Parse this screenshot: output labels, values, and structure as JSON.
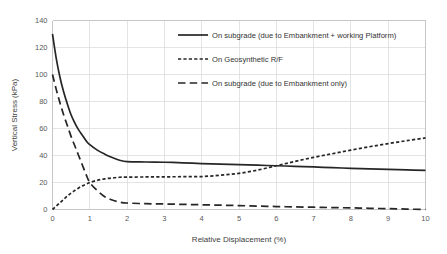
{
  "chart_data": {
    "type": "line",
    "title": "",
    "xlabel": "Relative Displacement (%)",
    "ylabel": "Vertical Stress (kPa)",
    "xlim": [
      0,
      10
    ],
    "ylim": [
      0,
      140
    ],
    "xticks": [
      "0",
      "1",
      "2",
      "3",
      "4",
      "5",
      "6",
      "7",
      "8",
      "9",
      "10"
    ],
    "yticks": [
      "0",
      "20",
      "40",
      "60",
      "80",
      "100",
      "120",
      "140"
    ],
    "grid": true,
    "legend_position": "upper-right-inside",
    "line_color": "#262626",
    "grid_color": "#d9d9d9",
    "x": [
      0,
      0.1,
      0.2,
      0.3,
      0.4,
      0.5,
      0.6,
      0.7,
      0.8,
      0.9,
      1.0,
      1.2,
      1.4,
      1.6,
      1.8,
      2.0,
      2.5,
      3.0,
      3.5,
      4.0,
      4.5,
      5.0,
      5.5,
      6.0,
      6.5,
      7.0,
      7.5,
      8.0,
      8.5,
      9.0,
      9.5,
      10.0
    ],
    "series": [
      {
        "name": "On subgrade (due to Embankment + working Platform)",
        "style": "solid",
        "values": [
          130,
          112,
          98,
          87,
          78,
          70,
          64,
          59,
          55,
          51,
          48,
          44,
          41,
          38.5,
          36.5,
          35.5,
          35.2,
          35,
          34.6,
          34,
          33.6,
          33.2,
          32.8,
          32.4,
          32,
          31.5,
          31,
          30.5,
          30.1,
          29.7,
          29.3,
          29
        ]
      },
      {
        "name": "On Geosynthetic R/F",
        "style": "dotted",
        "values": [
          0,
          2.5,
          5,
          7.5,
          10,
          12.2,
          14.2,
          16,
          17.5,
          18.8,
          20,
          21.6,
          22.7,
          23.4,
          23.9,
          24,
          24.1,
          24.2,
          24.3,
          24.4,
          25.4,
          26.8,
          29.2,
          32.4,
          35.6,
          38.6,
          41.3,
          44,
          46.5,
          48.8,
          51,
          53
        ]
      },
      {
        "name": "On subgrade (due to Embankment only)",
        "style": "dashed",
        "values": [
          100,
          89,
          79,
          70,
          62,
          54,
          47,
          40,
          33,
          26,
          20,
          14,
          9.5,
          7,
          5.5,
          4.8,
          4.3,
          4.1,
          3.8,
          3.5,
          3.2,
          2.9,
          2.5,
          2.2,
          1.9,
          1.7,
          1.4,
          1.2,
          0.9,
          0.6,
          0.3,
          0
        ]
      }
    ]
  },
  "legend": {
    "items": [
      {
        "label": "On subgrade (due to Embankment + working Platform)",
        "style": "solid"
      },
      {
        "label": "On Geosynthetic R/F",
        "style": "dotted"
      },
      {
        "label": "On subgrade (due to Embankment only)",
        "style": "dashed"
      }
    ]
  }
}
